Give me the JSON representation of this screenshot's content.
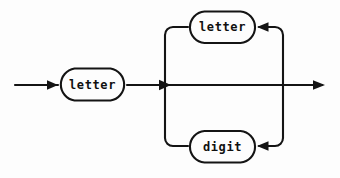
{
  "diagram": {
    "type": "railroad-syntax-diagram",
    "background_color": "#fdfdfd",
    "line_color": "#141414",
    "text_color": "#101010",
    "nodes": [
      {
        "id": "start-letter",
        "label": "letter",
        "shape": "stadium",
        "x": 58,
        "y": 68,
        "width": 69,
        "height": 33
      },
      {
        "id": "loop-letter",
        "label": "letter",
        "shape": "stadium",
        "x": 188,
        "y": 11,
        "width": 69,
        "height": 32
      },
      {
        "id": "loop-digit",
        "label": "digit",
        "shape": "stadium",
        "x": 188,
        "y": 131,
        "width": 69,
        "height": 32
      }
    ],
    "connectors": [
      {
        "id": "entry-arrow",
        "kind": "arrow",
        "direction": "right",
        "from_x": 15,
        "to_x": 58,
        "y": 85
      },
      {
        "id": "start-to-junction",
        "kind": "line",
        "direction": "right",
        "from_x": 127,
        "to_x": 165,
        "y": 85
      },
      {
        "id": "junction-arrow",
        "kind": "arrow",
        "direction": "right",
        "x": 165,
        "y": 85
      },
      {
        "id": "main-through-line",
        "kind": "line",
        "direction": "right",
        "from_x": 165,
        "to_x": 325,
        "y": 85
      },
      {
        "id": "exit-arrow",
        "kind": "arrow",
        "direction": "right",
        "to_x": 325,
        "y": 85
      },
      {
        "id": "left-rail",
        "kind": "line",
        "direction": "vertical",
        "x": 165,
        "from_y": 27,
        "to_y": 146
      },
      {
        "id": "right-rail",
        "kind": "line",
        "direction": "vertical",
        "x": 283,
        "from_y": 27,
        "to_y": 146
      },
      {
        "id": "top-feedback-arrow",
        "kind": "arrow",
        "direction": "left",
        "to_x": 257,
        "y": 27
      },
      {
        "id": "bottom-feedback-arrow",
        "kind": "arrow",
        "direction": "left",
        "to_x": 257,
        "y": 146
      }
    ]
  }
}
